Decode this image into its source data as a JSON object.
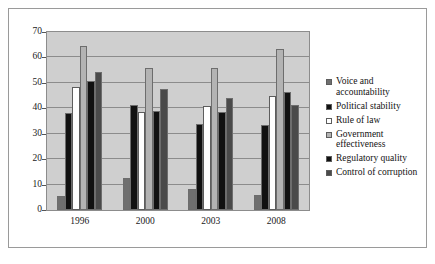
{
  "chart_data": {
    "type": "bar",
    "title": "",
    "subtitle": "",
    "xlabel": "",
    "ylabel": "",
    "categories": [
      "1996",
      "2000",
      "2003",
      "2008"
    ],
    "ylim": [
      0,
      70
    ],
    "ytick_labels": [
      "0",
      "10",
      "20",
      "30",
      "40",
      "50",
      "60",
      "70"
    ],
    "ytick_values": [
      0,
      10,
      20,
      30,
      40,
      50,
      60,
      70
    ],
    "grid": true,
    "legend_position": "right",
    "plot_background": "#cfcfcf",
    "series": [
      {
        "name": "Voice and\naccountability",
        "color": "#6f6f6f",
        "values": [
          5.5,
          12.5,
          8.2,
          6.0
        ]
      },
      {
        "name": "Political stability",
        "color": "#111111",
        "values": [
          38.0,
          41.3,
          34.0,
          33.6
        ]
      },
      {
        "name": "Rule of law",
        "color": "#ffffff",
        "values": [
          48.5,
          38.5,
          41.0,
          45.0
        ]
      },
      {
        "name": "Government\neffectiveness",
        "color": "#b3b3b3",
        "values": [
          64.5,
          56.0,
          56.0,
          63.5
        ]
      },
      {
        "name": "Regulatory quality",
        "color": "#111111",
        "values": [
          50.7,
          39.0,
          38.5,
          46.5
        ]
      },
      {
        "name": "Control of corruption",
        "color": "#4a4a4a",
        "values": [
          54.2,
          47.6,
          44.2,
          41.2
        ]
      }
    ]
  }
}
